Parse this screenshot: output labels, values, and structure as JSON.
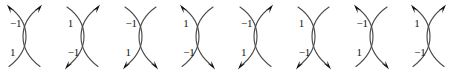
{
  "figure": {
    "type": "knot-crossing-diagram-row",
    "count": 8,
    "stroke_color": "#4a4a4a",
    "arrow_color": "#111111",
    "background_color": "#ffffff",
    "diagrams": [
      {
        "index": 1,
        "label_top": "−1",
        "label_bottom": "1",
        "arrows": [
          "top-left",
          "top-right"
        ]
      },
      {
        "index": 2,
        "label_top": "1",
        "label_bottom": "−1",
        "arrows": [
          "top-right",
          "bottom-left"
        ]
      },
      {
        "index": 3,
        "label_top": "−1",
        "label_bottom": "1",
        "arrows": [
          "bottom-left",
          "bottom-right"
        ]
      },
      {
        "index": 4,
        "label_top": "1",
        "label_bottom": "−1",
        "arrows": [
          "top-left",
          "bottom-right"
        ]
      },
      {
        "index": 5,
        "label_top": "−1",
        "label_bottom": "1",
        "arrows": [
          "top-right",
          "bottom-left"
        ]
      },
      {
        "index": 6,
        "label_top": "1",
        "label_bottom": "−1",
        "arrows": [
          "bottom-left",
          "bottom-right"
        ]
      },
      {
        "index": 7,
        "label_top": "−1",
        "label_bottom": "1",
        "arrows": [
          "top-left",
          "bottom-right"
        ]
      },
      {
        "index": 8,
        "label_top": "1",
        "label_bottom": "−1",
        "arrows": [
          "top-left",
          "top-right"
        ]
      }
    ]
  }
}
